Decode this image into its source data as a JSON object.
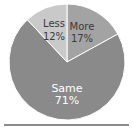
{
  "chart_data": {
    "type": "pie",
    "title": "",
    "categories": [
      "More",
      "Same",
      "Less"
    ],
    "values": [
      17,
      71,
      12
    ],
    "labels": [
      "More 17%",
      "Same 71%",
      "Less 12%"
    ],
    "colors": [
      "#a3a3a3",
      "#8a8a8a",
      "#c9c9c9"
    ],
    "start_angle_deg": 90,
    "direction": "clockwise",
    "legend": "none (inline labels)"
  },
  "slices": [
    {
      "name": "More",
      "pct": "17%"
    },
    {
      "name": "Same",
      "pct": "71%"
    },
    {
      "name": "Less",
      "pct": "12%"
    }
  ]
}
